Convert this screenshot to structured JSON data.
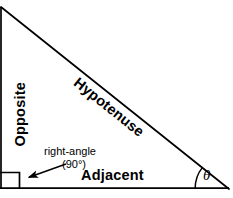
{
  "figure": {
    "type": "geometry-diagram",
    "background_color": "#ffffff",
    "stroke_color": "#000000",
    "width": 233,
    "height": 198
  },
  "labels": {
    "opposite": "Opposite",
    "hypotenuse": "Hypotenuse",
    "adjacent": "Adjacent",
    "right_angle": "right-angle",
    "right_angle_degrees": "(90°)",
    "theta": "θ"
  },
  "geometry": {
    "triangle": {
      "vertices": [
        {
          "name": "top-left",
          "x": 2,
          "y": 8
        },
        {
          "name": "bottom-left",
          "x": 2,
          "y": 188
        },
        {
          "name": "bottom-right",
          "x": 228,
          "y": 188
        }
      ],
      "sides": [
        {
          "name": "opposite",
          "from": "top-left",
          "to": "bottom-left"
        },
        {
          "name": "adjacent",
          "from": "bottom-left",
          "to": "bottom-right"
        },
        {
          "name": "hypotenuse",
          "from": "top-left",
          "to": "bottom-right"
        }
      ],
      "stroke_width": 1.6
    },
    "right_angle_marker": {
      "x": 2,
      "y": 172,
      "size": 16,
      "at_vertex": "bottom-left"
    },
    "theta_arc": {
      "center_x": 228,
      "center_y": 188,
      "radius": 33,
      "at_vertex": "bottom-right"
    },
    "annotation_arrow": {
      "from_x": 66,
      "from_y": 164,
      "to_x": 26,
      "to_y": 178
    }
  }
}
